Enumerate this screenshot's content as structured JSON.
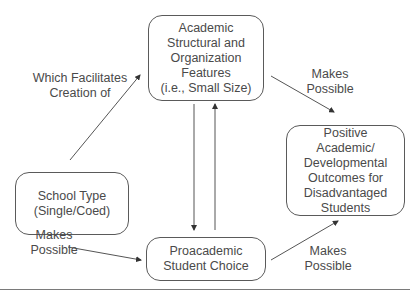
{
  "nodes": {
    "academic_features": "Academic\nStructural and\nOrganization\nFeatures\n(i.e., Small Size)",
    "school_type": "School Type\n(Single/Coed)",
    "student_choice": "Proacademic\nStudent Choice",
    "outcomes": "Positive\nAcademic/\nDevelopmental\nOutcomes for\nDisadvantaged\nStudents"
  },
  "edge_labels": {
    "school_to_features": "Which Facilitates\nCreation of",
    "features_to_outcomes": "Makes\nPossible",
    "school_to_choice": "Makes\nPossible",
    "choice_to_outcomes": "Makes\nPossible"
  },
  "edges": [
    {
      "from": "school_type",
      "to": "academic_features"
    },
    {
      "from": "academic_features",
      "to": "outcomes"
    },
    {
      "from": "school_type",
      "to": "student_choice"
    },
    {
      "from": "student_choice",
      "to": "outcomes"
    },
    {
      "from": "academic_features",
      "to": "student_choice"
    },
    {
      "from": "student_choice",
      "to": "academic_features"
    }
  ]
}
